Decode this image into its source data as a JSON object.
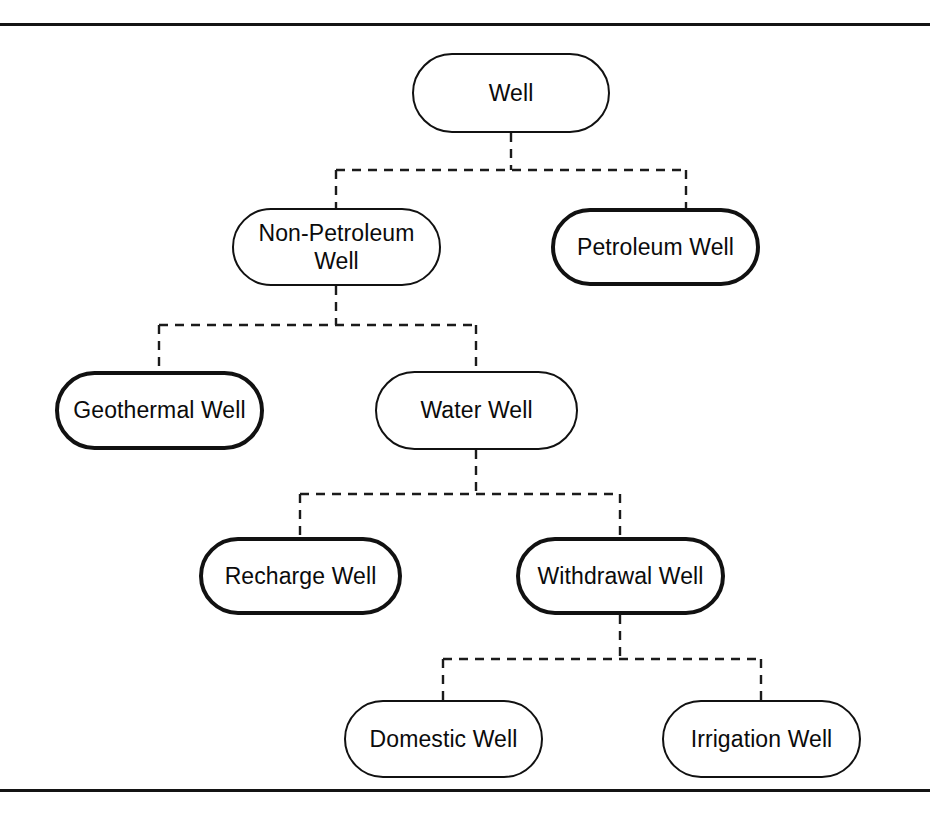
{
  "diagram": {
    "background_color": "#ffffff",
    "line_color": "#111111",
    "connector_style": "dashed-orthogonal",
    "frame": {
      "top_rule": true,
      "bottom_rule": true,
      "side_rules": false
    },
    "nodes": [
      {
        "id": "well",
        "label": "Well",
        "level": 1,
        "border": "thin",
        "x": 412,
        "y": 53,
        "w": 198,
        "h": 80
      },
      {
        "id": "non-petroleum-well",
        "label": "Non-Petroleum\nWell",
        "level": 2,
        "border": "thin",
        "x": 232,
        "y": 208,
        "w": 209,
        "h": 78
      },
      {
        "id": "petroleum-well",
        "label": "Petroleum Well",
        "level": 2,
        "border": "thick",
        "x": 551,
        "y": 208,
        "w": 209,
        "h": 78
      },
      {
        "id": "geothermal-well",
        "label": "Geothermal Well",
        "level": 3,
        "border": "thick",
        "x": 55,
        "y": 371,
        "w": 209,
        "h": 79
      },
      {
        "id": "water-well",
        "label": "Water Well",
        "level": 3,
        "border": "thin",
        "x": 375,
        "y": 371,
        "w": 203,
        "h": 79
      },
      {
        "id": "recharge-well",
        "label": "Recharge Well",
        "level": 4,
        "border": "thick",
        "x": 199,
        "y": 537,
        "w": 203,
        "h": 78
      },
      {
        "id": "withdrawal-well",
        "label": "Withdrawal Well",
        "level": 4,
        "border": "thick",
        "x": 516,
        "y": 537,
        "w": 209,
        "h": 78
      },
      {
        "id": "domestic-well",
        "label": "Domestic Well",
        "level": 5,
        "border": "thin",
        "x": 344,
        "y": 700,
        "w": 199,
        "h": 78
      },
      {
        "id": "irrigation-well",
        "label": "Irrigation Well",
        "level": 5,
        "border": "thin",
        "x": 662,
        "y": 700,
        "w": 199,
        "h": 78
      }
    ],
    "edges": [
      {
        "from": "well",
        "to": "non-petroleum-well"
      },
      {
        "from": "well",
        "to": "petroleum-well"
      },
      {
        "from": "non-petroleum-well",
        "to": "geothermal-well"
      },
      {
        "from": "non-petroleum-well",
        "to": "water-well"
      },
      {
        "from": "water-well",
        "to": "recharge-well"
      },
      {
        "from": "water-well",
        "to": "withdrawal-well"
      },
      {
        "from": "withdrawal-well",
        "to": "domestic-well"
      },
      {
        "from": "withdrawal-well",
        "to": "irrigation-well"
      }
    ],
    "connector_paths": [
      "M 511 133 L 511 170 M 336 170 L 686 170 M 336 170 L 336 208 M 686 170 L 686 208",
      "M 336 286 L 336 325 M 159 325 L 476 325 M 159 325 L 159 371 M 476 325 L 476 371",
      "M 476 450 L 476 494 M 300 494 L 620 494 M 300 494 L 300 537 M 620 494 L 620 537",
      "M 620 615 L 620 659 M 443 659 L 761 659 M 443 659 L 443 700 M 761 659 L 761 700"
    ]
  }
}
